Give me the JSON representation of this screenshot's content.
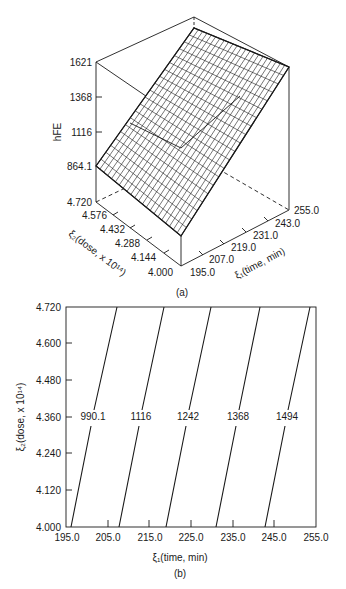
{
  "chart_data": [
    {
      "panel": "(a)",
      "type": "surface3d",
      "title": "",
      "zlabel": "hFE",
      "xlabel": "ξ1(time, min)",
      "ylabel": "ξ2(dose, x 10^14)",
      "z_ticks": [
        "1621",
        "1368",
        "1116",
        "864.1"
      ],
      "x_ticks": [
        "195.0",
        "207.0",
        "219.0",
        "231.0",
        "243.0",
        "255.0"
      ],
      "y_ticks": [
        "4.720",
        "4.576",
        "4.432",
        "4.288",
        "4.144",
        "4.000"
      ],
      "zlim": [
        864.1,
        1621
      ],
      "xlim": [
        195.0,
        255.0
      ],
      "ylim": [
        4.0,
        4.72
      ],
      "surface": "planar response surface, hFE increasing with time; mesh grid",
      "corners": [
        {
          "time": 195.0,
          "dose": 4.0,
          "hFE": 864.1
        },
        {
          "time": 195.0,
          "dose": 4.72,
          "hFE": 990.1
        },
        {
          "time": 255.0,
          "dose": 4.0,
          "hFE": 1494
        },
        {
          "time": 255.0,
          "dose": 4.72,
          "hFE": 1621
        }
      ]
    },
    {
      "panel": "(b)",
      "type": "contour",
      "title": "",
      "xlabel": "ξ1(time, min)",
      "ylabel": "ξ2(dose, x 10^14)",
      "x_ticks": [
        "195.0",
        "205.0",
        "215.0",
        "225.0",
        "235.0",
        "245.0",
        "255.0"
      ],
      "y_ticks": [
        "4.000",
        "4.120",
        "4.240",
        "4.360",
        "4.480",
        "4.600",
        "4.720"
      ],
      "xlim": [
        195.0,
        255.0
      ],
      "ylim": [
        4.0,
        4.72
      ],
      "grid": false,
      "contours": [
        {
          "level": "990.1",
          "x_at_y_min": 196.0,
          "x_at_y_max": 207.3
        },
        {
          "level": "1116",
          "x_at_y_min": 207.6,
          "x_at_y_max": 219.0
        },
        {
          "level": "1242",
          "x_at_y_min": 219.0,
          "x_at_y_max": 230.2
        },
        {
          "level": "1368",
          "x_at_y_min": 230.9,
          "x_at_y_max": 242.0
        },
        {
          "level": "1494",
          "x_at_y_min": 242.8,
          "x_at_y_max": 253.7
        }
      ]
    }
  ],
  "panel_a": {
    "caption": "(a)",
    "zlabel": "hFE",
    "z_ticks": [
      "1621",
      "1368",
      "1116",
      "864.1"
    ],
    "dose_ticks": [
      "4.720",
      "4.576",
      "4.432",
      "4.288",
      "4.144",
      "4.000"
    ],
    "time_ticks": [
      "195.0",
      "207.0",
      "219.0",
      "231.0",
      "243.0",
      "255.0"
    ],
    "dose_label": "ξ₂(dose, x 10¹⁴)",
    "time_label": "ξ₁(time, min)"
  },
  "panel_b": {
    "caption": "(b)",
    "ylabel": "ξ₂(dose, x 10¹⁴)",
    "xlabel": "ξ₁(time, min)",
    "y_ticks": [
      "4.720",
      "4.600",
      "4.480",
      "4.360",
      "4.240",
      "4.120",
      "4.000"
    ],
    "x_ticks": [
      "195.0",
      "205.0",
      "215.0",
      "225.0",
      "235.0",
      "245.0",
      "255.0"
    ],
    "contour_labels": [
      "990.1",
      "1116",
      "1242",
      "1368",
      "1494"
    ]
  }
}
